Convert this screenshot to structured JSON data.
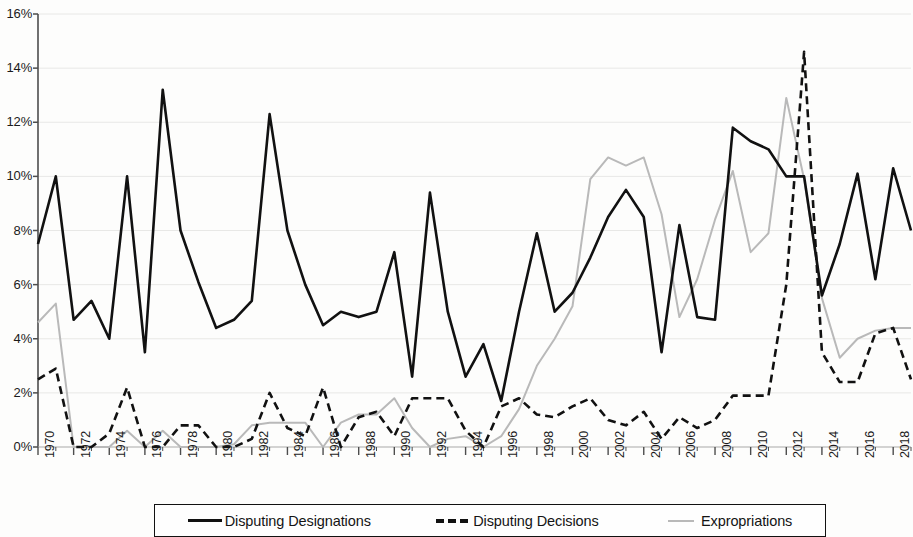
{
  "chart_data": {
    "type": "line",
    "title": "",
    "xlabel": "",
    "ylabel": "",
    "xlim": [
      1970,
      2019
    ],
    "ylim": [
      0,
      16
    ],
    "ytick_labels": [
      "0%",
      "2%",
      "4%",
      "6%",
      "8%",
      "10%",
      "12%",
      "14%",
      "16%"
    ],
    "ytick_values": [
      0,
      2,
      4,
      6,
      8,
      10,
      12,
      14,
      16
    ],
    "xtick_labels": [
      "1970",
      "1972",
      "1974",
      "1976",
      "1978",
      "1980",
      "1982",
      "1984",
      "1986",
      "1988",
      "1990",
      "1992",
      "1994",
      "1996",
      "1998",
      "2000",
      "2002",
      "2004",
      "2006",
      "2008",
      "2010",
      "2012",
      "2014",
      "2016",
      "2018"
    ],
    "xtick_values": [
      1970,
      1972,
      1974,
      1976,
      1978,
      1980,
      1982,
      1984,
      1986,
      1988,
      1990,
      1992,
      1994,
      1996,
      1998,
      2000,
      2002,
      2004,
      2006,
      2008,
      2010,
      2012,
      2014,
      2016,
      2018
    ],
    "grid": true,
    "legend_position": "bottom",
    "x": [
      1970,
      1971,
      1972,
      1973,
      1974,
      1975,
      1976,
      1977,
      1978,
      1979,
      1980,
      1981,
      1982,
      1983,
      1984,
      1985,
      1986,
      1987,
      1988,
      1989,
      1990,
      1991,
      1992,
      1993,
      1994,
      1995,
      1996,
      1997,
      1998,
      1999,
      2000,
      2001,
      2002,
      2003,
      2004,
      2005,
      2006,
      2007,
      2008,
      2009,
      2010,
      2011,
      2012,
      2013,
      2014,
      2015,
      2016,
      2017,
      2018,
      2019
    ],
    "series": [
      {
        "name": "Disputing Designations",
        "color": "#111111",
        "style": "solid",
        "values": [
          7.5,
          10.0,
          4.7,
          5.4,
          4.0,
          10.0,
          3.5,
          13.2,
          8.0,
          6.1,
          4.4,
          4.7,
          5.4,
          12.3,
          8.0,
          6.0,
          4.5,
          5.0,
          4.8,
          5.0,
          7.2,
          2.6,
          9.4,
          5.0,
          2.6,
          3.8,
          1.7,
          5.0,
          7.9,
          5.0,
          5.7,
          7.0,
          8.5,
          9.5,
          8.5,
          3.5,
          8.2,
          4.8,
          4.7,
          11.8,
          11.3,
          11.0,
          10.0,
          10.0,
          5.6,
          7.5,
          10.1,
          6.2,
          10.3,
          8.0
        ]
      },
      {
        "name": "Disputing Decisions",
        "color": "#111111",
        "style": "dashed",
        "values": [
          2.5,
          2.9,
          0.0,
          0.0,
          0.5,
          2.2,
          0.0,
          0.0,
          0.8,
          0.8,
          0.0,
          0.0,
          0.3,
          2.0,
          0.7,
          0.4,
          2.2,
          0.0,
          1.1,
          1.3,
          0.4,
          1.8,
          1.8,
          1.8,
          0.6,
          0.0,
          1.5,
          1.8,
          1.2,
          1.1,
          1.5,
          1.8,
          1.0,
          0.8,
          1.3,
          0.3,
          1.1,
          0.7,
          1.0,
          1.9,
          1.9,
          1.9,
          6.0,
          14.6,
          3.5,
          2.4,
          2.4,
          4.2,
          4.4,
          2.5
        ]
      },
      {
        "name": "Expropriations",
        "color": "#b9b9b9",
        "style": "solid",
        "values": [
          4.6,
          5.3,
          0.0,
          0.0,
          0.0,
          0.6,
          0.0,
          0.6,
          0.0,
          0.0,
          0.0,
          0.1,
          0.8,
          0.9,
          0.9,
          0.9,
          0.0,
          0.9,
          1.2,
          1.2,
          1.8,
          0.7,
          0.0,
          0.3,
          0.4,
          0.0,
          0.4,
          1.4,
          3.0,
          4.0,
          5.2,
          9.9,
          10.7,
          10.4,
          10.7,
          8.6,
          4.8,
          6.2,
          8.4,
          10.2,
          7.2,
          7.9,
          12.9,
          9.9,
          5.5,
          3.3,
          4.0,
          4.3,
          4.4,
          4.4
        ]
      }
    ]
  },
  "legend": {
    "items": [
      {
        "label": "Disputing Designations",
        "style": "solid-black"
      },
      {
        "label": "Disputing Decisions",
        "style": "dashed-black"
      },
      {
        "label": "Expropriations",
        "style": "solid-gray"
      }
    ]
  }
}
